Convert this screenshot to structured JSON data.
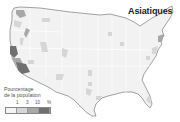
{
  "map": {
    "title": "Asiatiques",
    "region": "United States (contiguous)",
    "legend": {
      "title_line1": "Pourcentage",
      "title_line2": "de la population",
      "ticks": [
        "1",
        "3",
        "10",
        "%"
      ],
      "classes": [
        {
          "label": "< 1",
          "color": "#f4f4f4"
        },
        {
          "label": "1 – 3",
          "color": "#d6d6d6"
        },
        {
          "label": "3 – 10",
          "color": "#a8a8a8"
        },
        {
          "label": "> 10",
          "color": "#707070"
        }
      ]
    },
    "colors": {
      "land": "#f2f2f2",
      "border": "#8a8a8a",
      "state_lines": "#ffffff",
      "low": "#d6d6d6",
      "mid": "#a8a8a8",
      "high": "#707070"
    }
  }
}
